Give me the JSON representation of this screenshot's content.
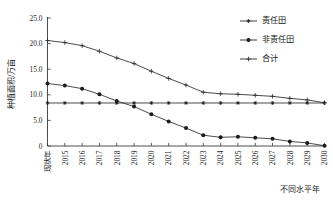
{
  "chart_data": {
    "type": "line",
    "title": "",
    "xlabel": "不同水平年",
    "ylabel": "种植面积/万亩",
    "categories": [
      "现状年",
      "2015",
      "2016",
      "2017",
      "2018",
      "2019",
      "2020",
      "2021",
      "2022",
      "2023",
      "2024",
      "2025",
      "2026",
      "2027",
      "2028",
      "2029",
      "2030"
    ],
    "ylim": [
      0,
      25
    ],
    "ytick_labels": [
      "25.0",
      "20.0",
      "15.0",
      "10.0",
      "5.0",
      "0"
    ],
    "ytick_values": [
      25,
      20,
      15,
      10,
      5,
      0
    ],
    "grid": false,
    "legend_position": "top-right",
    "series": [
      {
        "name": "责任田",
        "marker": "star",
        "values": [
          8.4,
          8.4,
          8.4,
          8.4,
          8.4,
          8.4,
          8.4,
          8.4,
          8.4,
          8.4,
          8.4,
          8.4,
          8.4,
          8.4,
          8.4,
          8.4,
          8.4
        ]
      },
      {
        "name": "非责任田",
        "marker": "dot",
        "values": [
          12.2,
          11.8,
          11.2,
          10.1,
          8.8,
          7.7,
          6.2,
          4.8,
          3.5,
          2.1,
          1.7,
          1.8,
          1.6,
          1.4,
          0.9,
          0.6,
          0.05
        ]
      },
      {
        "name": "合计",
        "marker": "plus",
        "values": [
          20.6,
          20.2,
          19.6,
          18.5,
          17.2,
          16.1,
          14.6,
          13.2,
          11.9,
          10.5,
          10.2,
          10.1,
          9.9,
          9.7,
          9.3,
          9.0,
          8.45
        ]
      }
    ]
  },
  "legend": {
    "items": [
      {
        "label": "责任田"
      },
      {
        "label": "非责任田"
      },
      {
        "label": "合计"
      }
    ]
  },
  "axes": {
    "y_title": "种植面积/万亩",
    "x_title": "不同水平年"
  },
  "colors": {
    "line": "#2b2b2b",
    "axis": "#3a3a3a",
    "text": "#1a1a1a",
    "background": "#ffffff"
  }
}
